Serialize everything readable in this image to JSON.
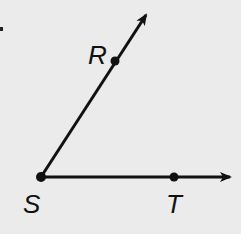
{
  "diagram": {
    "vertex": {
      "label": "S",
      "x": 41,
      "y": 177
    },
    "points": [
      {
        "label": "R",
        "x": 115,
        "y": 61,
        "label_x": 86,
        "label_y": 63
      },
      {
        "label": "T",
        "x": 174,
        "y": 177,
        "label_x": 165,
        "label_y": 212
      },
      {
        "label": "S",
        "x": 41,
        "y": 177,
        "label_x": 22,
        "label_y": 212
      }
    ],
    "rays": [
      {
        "name": "SR",
        "from": "S",
        "through": "R",
        "tip_x": 148,
        "tip_y": 12
      },
      {
        "name": "ST",
        "from": "S",
        "through": "T",
        "tip_x": 232,
        "tip_y": 177
      }
    ],
    "colors": {
      "stroke": "#111111",
      "background": "#ebebeb"
    }
  }
}
